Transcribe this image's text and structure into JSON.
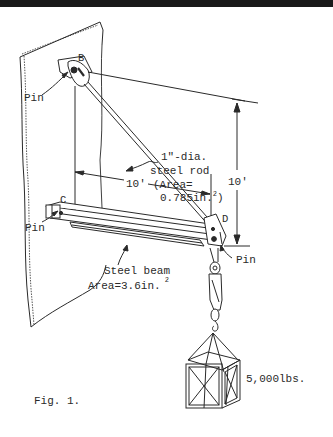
{
  "figure": {
    "caption": "Fig. 1.",
    "top_rule_color": "#1a1a1a",
    "ink_color": "#2a2a2a",
    "background": "#ffffff"
  },
  "labels": {
    "point_b": "B",
    "point_c": "C",
    "point_d": "D",
    "pin_b": "Pin",
    "pin_c": "Pin",
    "pin_d": "Pin",
    "rod_line1": "1\"-dia.",
    "rod_line2": "steel rod",
    "rod_line3": "(Area=",
    "rod_line4_value": "0.785in.",
    "rod_line4_sup": "2",
    "rod_line4_close": ")",
    "beam_line1": "Steel beam",
    "beam_line2_value": "Area=3.6in.",
    "beam_line2_sup": "2",
    "dim_horizontal": "10'",
    "dim_vertical": "10'",
    "load": "5,000lbs."
  },
  "components": {
    "rod": {
      "name": "steel rod",
      "diameter_in": 1,
      "area_in2": 0.785
    },
    "beam": {
      "name": "steel beam",
      "area_in2": 3.6
    },
    "load_lbs": 5000,
    "horizontal_span_ft": 10,
    "vertical_span_ft": 10
  }
}
